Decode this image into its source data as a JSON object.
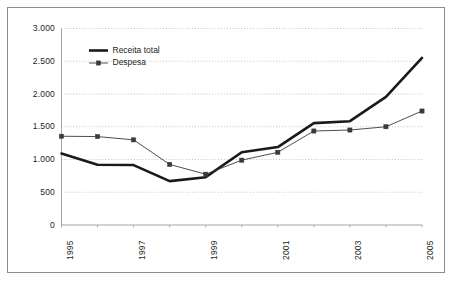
{
  "chart_data": {
    "type": "line",
    "title": "",
    "subtitle": "",
    "xlabel": "",
    "ylabel": "",
    "x": [
      1995,
      1996,
      1997,
      1998,
      1999,
      2000,
      2001,
      2002,
      2003,
      2004,
      2005
    ],
    "categories": [
      "1995",
      "1996",
      "1997",
      "1998",
      "1999",
      "2000",
      "2001",
      "2002",
      "2003",
      "2004",
      "2005"
    ],
    "x_tick_labels": [
      "1995",
      "1997",
      "1999",
      "2001",
      "2003",
      "2005"
    ],
    "x_tick_values": [
      1995,
      1997,
      1999,
      2001,
      2003,
      2005
    ],
    "y_tick_labels": [
      "0",
      "500",
      "1.000",
      "1.500",
      "2.000",
      "2.500",
      "3.000"
    ],
    "y_tick_values": [
      0,
      500,
      1000,
      1500,
      2000,
      2500,
      3000
    ],
    "ylim": [
      0,
      3000
    ],
    "xlim": [
      1995,
      2005
    ],
    "grid": "horizontal-dotted",
    "legend_position": "top-left-inside",
    "series": [
      {
        "name": "Receita total",
        "style": "thick-solid-no-marker",
        "color": "#1a1a1a",
        "line_width": 2.6,
        "marker": "none",
        "values": [
          1090,
          920,
          915,
          670,
          730,
          1110,
          1190,
          1555,
          1585,
          1955,
          2550
        ]
      },
      {
        "name": "Despesa",
        "style": "thin-solid-square-marker",
        "color": "#3a3a3a",
        "line_width": 0.9,
        "marker": "square",
        "values": [
          1355,
          1350,
          1300,
          925,
          775,
          990,
          1110,
          1435,
          1450,
          1500,
          1740
        ]
      }
    ]
  },
  "legend": {
    "items": [
      {
        "label": "Receita total"
      },
      {
        "label": "Despesa"
      }
    ]
  },
  "colors": {
    "frame_border": "#8d8d8d",
    "axis": "#9a9a9a",
    "gridline": "#b4b4b4",
    "series_receita": "#1a1a1a",
    "series_despesa": "#3a3a3a",
    "text": "#231f20",
    "background": "#ffffff"
  }
}
